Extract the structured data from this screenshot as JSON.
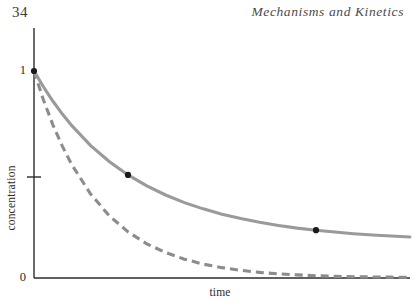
{
  "page": {
    "folio": "34",
    "running_head": "Mechanisms and Kinetics",
    "width": 414,
    "height": 305,
    "background": "#ffffff"
  },
  "figure": {
    "axis_color": "#2b2b2b",
    "solid_curve_color": "#9a9a9a",
    "dashed_curve_color": "#8c8c8c",
    "marker_color": "#1a1a1a"
  },
  "chart_data": {
    "type": "line",
    "title": "",
    "subtitle": "",
    "xlabel": "time",
    "ylabel": "concentration",
    "xlim": [
      0,
      10
    ],
    "ylim": [
      0,
      1
    ],
    "grid": false,
    "legend": null,
    "xticks": [],
    "xticklabels": [],
    "yticks": [
      0,
      0.5,
      1
    ],
    "yticklabels": [
      "0",
      "",
      "1"
    ],
    "annotations": [],
    "series": [
      {
        "name": "solid",
        "style": "solid",
        "color": "#9a9a9a",
        "x": [
          0,
          0.25,
          0.5,
          0.75,
          1,
          1.5,
          2,
          2.5,
          3,
          3.5,
          4,
          4.5,
          5,
          5.5,
          6,
          6.5,
          7,
          7.5,
          8,
          8.5,
          9,
          9.5,
          10
        ],
        "y": [
          1.0,
          0.924,
          0.855,
          0.793,
          0.737,
          0.641,
          0.563,
          0.498,
          0.445,
          0.401,
          0.364,
          0.334,
          0.308,
          0.287,
          0.269,
          0.254,
          0.241,
          0.231,
          0.222,
          0.214,
          0.208,
          0.203,
          0.198
        ]
      },
      {
        "name": "dashed",
        "style": "dashed",
        "color": "#8c8c8c",
        "dash_pattern": [
          8,
          5
        ],
        "x": [
          0,
          0.25,
          0.5,
          0.75,
          1,
          1.5,
          2,
          2.5,
          3,
          3.5,
          4,
          4.5,
          5,
          5.5,
          6,
          6.5,
          7,
          7.5,
          8,
          8.5,
          9,
          9.5,
          10
        ],
        "y": [
          1.0,
          0.861,
          0.741,
          0.638,
          0.549,
          0.407,
          0.301,
          0.223,
          0.165,
          0.123,
          0.091,
          0.067,
          0.05,
          0.037,
          0.027,
          0.02,
          0.015,
          0.011,
          0.008,
          0.006,
          0.005,
          0.004,
          0.003
        ]
      }
    ],
    "markers": [
      {
        "x": 0,
        "y": 1.0,
        "series": "solid"
      },
      {
        "x": 2.5,
        "y": 0.498,
        "series": "solid"
      },
      {
        "x": 7.5,
        "y": 0.231,
        "series": "solid"
      }
    ]
  }
}
